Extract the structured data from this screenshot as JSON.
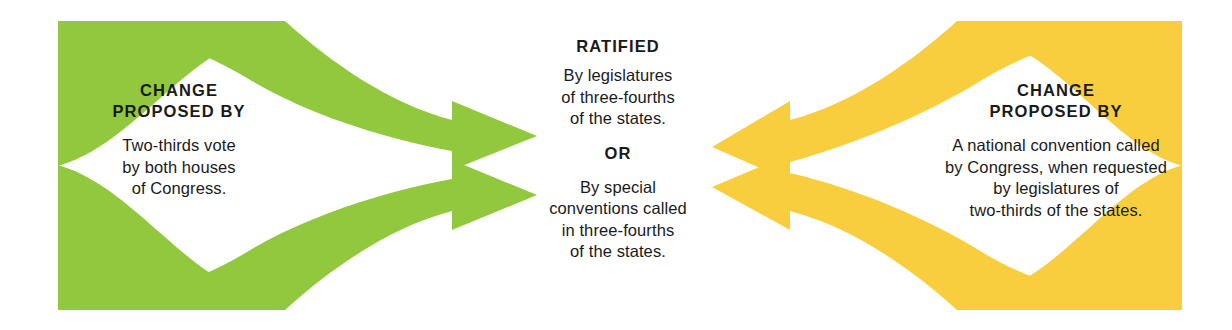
{
  "canvas": {
    "width": 1232,
    "height": 330,
    "background": "#ffffff"
  },
  "colors": {
    "green": "#92C83E",
    "yellow": "#F9CE3E",
    "text": "#1a1a1a",
    "background": "#ffffff"
  },
  "left": {
    "heading": "CHANGE\nPROPOSED BY",
    "body": "Two-thirds vote\nby both houses\nof Congress.",
    "arrow_color": "#92C83E",
    "arrow_direction": "right",
    "arrow_count": 2
  },
  "center": {
    "heading": "RATIFIED",
    "option_1": "By legislatures\nof three-fourths\nof the states.",
    "connector": "OR",
    "option_2": "By special\nconventions called\nin three-fourths\nof the states."
  },
  "right": {
    "heading": "CHANGE\nPROPOSED BY",
    "body": "A national convention called\nby Congress, when requested\nby legislatures of\ntwo-thirds of the states.",
    "arrow_color": "#F9CE3E",
    "arrow_direction": "left",
    "arrow_count": 2
  },
  "diagram_meta": {
    "title": "Amending the Constitution",
    "flow": "proposal-to-ratification"
  }
}
